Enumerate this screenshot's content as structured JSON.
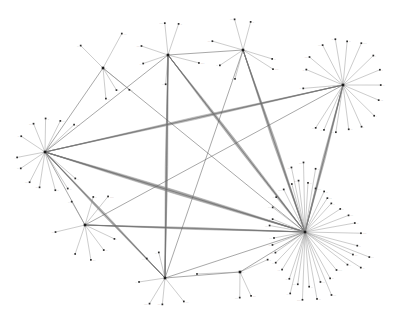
{
  "figure": {
    "kind": "network-graph",
    "layout": "force-directed",
    "background_color": "#ffffff",
    "width": 398,
    "height": 336,
    "edge_color": "#8d8d8d",
    "node_color": "#2b2b2b",
    "label_color": "#333333",
    "node_marker": "square-dot",
    "label_text_legible": false,
    "label_placeholder": "▫",
    "hub_count": 8,
    "node_count": 188,
    "edge_count": 262
  },
  "hubs": [
    {
      "id": "hub-upper-left",
      "name": "upper-left-hub",
      "x": 103,
      "y": 68,
      "degree": 14,
      "label": "▫▫"
    },
    {
      "id": "hub-top-center",
      "name": "top-center-hub",
      "x": 168,
      "y": 55,
      "degree": 22,
      "label": "▫▫"
    },
    {
      "id": "hub-top-right",
      "name": "top-right-hub",
      "x": 243,
      "y": 50,
      "degree": 20,
      "label": "▫▫"
    },
    {
      "id": "hub-right-upper",
      "name": "right-upper-hub",
      "x": 343,
      "y": 85,
      "degree": 28,
      "label": "▫▫"
    },
    {
      "id": "hub-left",
      "name": "left-hub",
      "x": 45,
      "y": 152,
      "degree": 24,
      "label": "▫▫"
    },
    {
      "id": "hub-lower-left",
      "name": "lower-left-hub",
      "x": 85,
      "y": 225,
      "degree": 16,
      "label": "▫▫"
    },
    {
      "id": "hub-bottom-mid",
      "name": "bottom-mid-hub",
      "x": 165,
      "y": 278,
      "degree": 18,
      "label": "▫▫"
    },
    {
      "id": "hub-bottom-right",
      "name": "bottom-right-hub",
      "x": 240,
      "y": 272,
      "degree": 9,
      "label": "▫▫"
    },
    {
      "id": "hub-right-dense",
      "name": "right-dense-hub",
      "x": 305,
      "y": 232,
      "degree": 52,
      "label": "▫▫"
    }
  ],
  "hub_links": [
    {
      "from": "hub-upper-left",
      "to": "hub-left"
    },
    {
      "from": "hub-upper-left",
      "to": "hub-right-dense"
    },
    {
      "from": "hub-top-center",
      "to": "hub-right-dense"
    },
    {
      "from": "hub-top-center",
      "to": "hub-bottom-mid"
    },
    {
      "from": "hub-top-center",
      "to": "hub-left"
    },
    {
      "from": "hub-top-right",
      "to": "hub-right-dense"
    },
    {
      "from": "hub-top-right",
      "to": "hub-bottom-mid"
    },
    {
      "from": "hub-right-upper",
      "to": "hub-right-dense"
    },
    {
      "from": "hub-right-upper",
      "to": "hub-left"
    },
    {
      "from": "hub-right-upper",
      "to": "hub-lower-left"
    },
    {
      "from": "hub-left",
      "to": "hub-right-dense"
    },
    {
      "from": "hub-left",
      "to": "hub-lower-left"
    },
    {
      "from": "hub-lower-left",
      "to": "hub-right-dense"
    },
    {
      "from": "hub-bottom-mid",
      "to": "hub-right-dense"
    },
    {
      "from": "hub-bottom-mid",
      "to": "hub-bottom-right"
    },
    {
      "from": "hub-bottom-right",
      "to": "hub-right-dense"
    },
    {
      "from": "hub-top-center",
      "to": "hub-top-right"
    },
    {
      "from": "hub-left",
      "to": "hub-bottom-mid"
    }
  ],
  "bundles": [
    {
      "name": "left-to-right-dense-bundle",
      "from": "hub-left",
      "to": "hub-right-dense",
      "strands": 11,
      "spread": 7
    },
    {
      "name": "topcenter-to-dense-bundle",
      "from": "hub-top-center",
      "to": "hub-right-dense",
      "strands": 9,
      "spread": 6
    },
    {
      "name": "topright-to-dense-bundle",
      "from": "hub-top-right",
      "to": "hub-right-dense",
      "strands": 8,
      "spread": 6
    },
    {
      "name": "left-to-bottommid-bundle",
      "from": "hub-left",
      "to": "hub-bottom-mid",
      "strands": 7,
      "spread": 5
    },
    {
      "name": "rightupper-to-left-bundle",
      "from": "hub-right-upper",
      "to": "hub-left",
      "strands": 6,
      "spread": 5
    },
    {
      "name": "bottommid-to-topcenter-bundle",
      "from": "hub-bottom-mid",
      "to": "hub-top-center",
      "strands": 8,
      "spread": 5
    },
    {
      "name": "lowerleft-to-dense-bundle",
      "from": "hub-lower-left",
      "to": "hub-right-dense",
      "strands": 6,
      "spread": 4
    },
    {
      "name": "rightupper-to-dense-bundle",
      "from": "hub-right-upper",
      "to": "hub-right-dense",
      "strands": 7,
      "spread": 5
    }
  ],
  "leaves": [
    {
      "hub": "hub-upper-left",
      "angle": -62,
      "radius": 38,
      "label": "▫▫▫"
    },
    {
      "hub": "hub-upper-left",
      "angle": -136,
      "radius": 30,
      "label": "▫▫"
    },
    {
      "hub": "hub-upper-left",
      "angle": 86,
      "radius": 32,
      "label": "▫▫"
    },
    {
      "hub": "hub-upper-left",
      "angle": 58,
      "radius": 26,
      "label": "▫"
    },
    {
      "hub": "hub-upper-left",
      "angle": 40,
      "radius": 34,
      "label": "▫▫"
    },
    {
      "hub": "hub-top-center",
      "angle": -96,
      "radius": 31,
      "label": "▫▫▫▫"
    },
    {
      "hub": "hub-top-center",
      "angle": -72,
      "radius": 33,
      "label": "▫▫"
    },
    {
      "hub": "hub-top-center",
      "angle": -160,
      "radius": 30,
      "label": "▫▫▫"
    },
    {
      "hub": "hub-top-center",
      "angle": 160,
      "radius": 27,
      "label": "▫▫"
    },
    {
      "hub": "hub-top-center",
      "angle": 14,
      "radius": 32,
      "label": "▫▫▫▫"
    },
    {
      "hub": "hub-top-center",
      "angle": 96,
      "radius": 30,
      "label": "▫▫"
    },
    {
      "hub": "hub-top-right",
      "angle": -104,
      "radius": 30,
      "label": "▫▫▫"
    },
    {
      "hub": "hub-top-right",
      "angle": -74,
      "radius": 28,
      "label": "▫▫"
    },
    {
      "hub": "hub-top-right",
      "angle": -164,
      "radius": 31,
      "label": "▫▫▫"
    },
    {
      "hub": "hub-top-right",
      "angle": 18,
      "radius": 30,
      "label": "▫▫"
    },
    {
      "hub": "hub-top-right",
      "angle": 34,
      "radius": 37,
      "label": "▫▫▫▫"
    },
    {
      "hub": "hub-top-right",
      "angle": 148,
      "radius": 29,
      "label": "▫▫"
    },
    {
      "hub": "hub-top-right",
      "angle": 104,
      "radius": 28,
      "label": "▫▫"
    },
    {
      "hub": "hub-right-upper",
      "angle": -118,
      "radius": 44,
      "label": "▫▫▫"
    },
    {
      "hub": "hub-right-upper",
      "angle": -100,
      "radius": 46,
      "label": "▫▫"
    },
    {
      "hub": "hub-right-upper",
      "angle": -84,
      "radius": 44,
      "label": "▫▫"
    },
    {
      "hub": "hub-right-upper",
      "angle": -66,
      "radius": 45,
      "label": "▫▫▫▫"
    },
    {
      "hub": "hub-right-upper",
      "angle": -140,
      "radius": 42,
      "label": "▫▫▫"
    },
    {
      "hub": "hub-right-upper",
      "angle": -158,
      "radius": 40,
      "label": "▫▫"
    },
    {
      "hub": "hub-right-upper",
      "angle": 176,
      "radius": 38,
      "label": "▫▫"
    },
    {
      "hub": "hub-right-upper",
      "angle": -44,
      "radius": 42,
      "label": "▫"
    },
    {
      "hub": "hub-right-upper",
      "angle": -22,
      "radius": 40,
      "label": "▫"
    },
    {
      "hub": "hub-right-upper",
      "angle": 0,
      "radius": 38,
      "label": "▫▫"
    },
    {
      "hub": "hub-right-upper",
      "angle": 22,
      "radius": 40,
      "label": "▫▫▫"
    },
    {
      "hub": "hub-right-upper",
      "angle": 44,
      "radius": 42,
      "label": "▫"
    },
    {
      "hub": "hub-right-upper",
      "angle": 66,
      "radius": 44,
      "label": "▫"
    },
    {
      "hub": "hub-right-upper",
      "angle": 84,
      "radius": 46,
      "label": "▫▫"
    },
    {
      "hub": "hub-right-upper",
      "angle": 100,
      "radius": 48,
      "label": "▫▫▫"
    },
    {
      "hub": "hub-right-upper",
      "angle": 112,
      "radius": 50,
      "label": "▫▫"
    },
    {
      "hub": "hub-right-upper",
      "angle": 124,
      "radius": 52,
      "label": "▫▫"
    },
    {
      "hub": "hub-left",
      "angle": -90,
      "radius": 34,
      "label": "▫▫"
    },
    {
      "hub": "hub-left",
      "angle": -112,
      "radius": 32,
      "label": "▫▫▫"
    },
    {
      "hub": "hub-left",
      "angle": -64,
      "radius": 36,
      "label": "▫▫▫"
    },
    {
      "hub": "hub-left",
      "angle": -44,
      "radius": 38,
      "label": "▫▫▫▫"
    },
    {
      "hub": "hub-left",
      "angle": -146,
      "radius": 30,
      "label": "▫▫"
    },
    {
      "hub": "hub-left",
      "angle": 170,
      "radius": 28,
      "label": "▫"
    },
    {
      "hub": "hub-left",
      "angle": 146,
      "radius": 30,
      "label": "▫▫"
    },
    {
      "hub": "hub-left",
      "angle": 118,
      "radius": 34,
      "label": "▫▫▫"
    },
    {
      "hub": "hub-left",
      "angle": 98,
      "radius": 36,
      "label": "▫▫"
    },
    {
      "hub": "hub-left",
      "angle": 76,
      "radius": 40,
      "label": "▫▫"
    },
    {
      "hub": "hub-left",
      "angle": 58,
      "radius": 44,
      "label": "▫▫"
    },
    {
      "hub": "hub-left",
      "angle": 42,
      "radius": 40,
      "label": "▫▫"
    },
    {
      "hub": "hub-lower-left",
      "angle": -74,
      "radius": 30,
      "label": "▫▫"
    },
    {
      "hub": "hub-lower-left",
      "angle": -52,
      "radius": 36,
      "label": "▫▫▫▫"
    },
    {
      "hub": "hub-lower-left",
      "angle": -120,
      "radius": 28,
      "label": "▫▫"
    },
    {
      "hub": "hub-lower-left",
      "angle": 168,
      "radius": 30,
      "label": "▫▫"
    },
    {
      "hub": "hub-lower-left",
      "angle": 108,
      "radius": 32,
      "label": "▫"
    },
    {
      "hub": "hub-lower-left",
      "angle": 80,
      "radius": 34,
      "label": "▫▫▫"
    },
    {
      "hub": "hub-lower-left",
      "angle": 52,
      "radius": 30,
      "label": "▫▫"
    },
    {
      "hub": "hub-lower-left",
      "angle": 24,
      "radius": 34,
      "label": "▫"
    },
    {
      "hub": "hub-bottom-mid",
      "angle": -104,
      "radius": 28,
      "label": "▫▫"
    },
    {
      "hub": "hub-bottom-mid",
      "angle": -134,
      "radius": 26,
      "label": "▫▫▫"
    },
    {
      "hub": "hub-bottom-mid",
      "angle": 172,
      "radius": 28,
      "label": "▫▫"
    },
    {
      "hub": "hub-bottom-mid",
      "angle": 120,
      "radius": 30,
      "label": "▫▫▫▫"
    },
    {
      "hub": "hub-bottom-mid",
      "angle": 96,
      "radius": 28,
      "label": "▫▫▫"
    },
    {
      "hub": "hub-bottom-mid",
      "angle": 52,
      "radius": 32,
      "label": "▫▫▫"
    },
    {
      "hub": "hub-bottom-right",
      "angle": 66,
      "radius": 26,
      "label": "▫▫▫"
    },
    {
      "hub": "hub-bottom-right",
      "angle": 92,
      "radius": 24,
      "label": "▫▫▫"
    },
    {
      "hub": "hub-bottom-right",
      "angle": -24,
      "radius": 30,
      "label": "▫▫"
    },
    {
      "hub": "hub-bottom-right",
      "angle": 178,
      "radius": 44,
      "label": "▫"
    },
    {
      "hub": "hub-right-dense",
      "angle": -142,
      "radius": 42,
      "label": "▫▫▫"
    },
    {
      "hub": "hub-right-dense",
      "angle": -130,
      "radius": 46,
      "label": "▫▫"
    },
    {
      "hub": "hub-right-dense",
      "angle": -118,
      "radius": 48,
      "label": "▫▫▫▫"
    },
    {
      "hub": "hub-right-dense",
      "angle": -106,
      "radius": 50,
      "label": "▫▫"
    },
    {
      "hub": "hub-right-dense",
      "angle": -96,
      "radius": 52,
      "label": "▫▫▫"
    },
    {
      "hub": "hub-right-dense",
      "angle": -86,
      "radius": 50,
      "label": "▫▫"
    },
    {
      "hub": "hub-right-dense",
      "angle": -76,
      "radius": 46,
      "label": "▫▫▫▫"
    },
    {
      "hub": "hub-right-dense",
      "angle": -66,
      "radius": 44,
      "label": "▫▫"
    },
    {
      "hub": "hub-right-dense",
      "angle": -56,
      "radius": 42,
      "label": "▫▫▫"
    },
    {
      "hub": "hub-right-dense",
      "angle": -46,
      "radius": 40,
      "label": "▫▫"
    },
    {
      "hub": "hub-right-dense",
      "angle": -34,
      "radius": 44,
      "label": "▫▫"
    },
    {
      "hub": "hub-right-dense",
      "angle": -22,
      "radius": 48,
      "label": "▫▫▫"
    },
    {
      "hub": "hub-right-dense",
      "angle": -10,
      "radius": 52,
      "label": "▫▫"
    },
    {
      "hub": "hub-right-dense",
      "angle": 2,
      "radius": 54,
      "label": "▫▫▫▫"
    },
    {
      "hub": "hub-right-dense",
      "angle": 14,
      "radius": 56,
      "label": "▫▫"
    },
    {
      "hub": "hub-right-dense",
      "angle": 26,
      "radius": 54,
      "label": "▫▫▫"
    },
    {
      "hub": "hub-right-dense",
      "angle": 38,
      "radius": 52,
      "label": "▫▫"
    },
    {
      "hub": "hub-right-dense",
      "angle": 50,
      "radius": 50,
      "label": "▫▫▫▫"
    },
    {
      "hub": "hub-right-dense",
      "angle": 62,
      "radius": 52,
      "label": "▫▫"
    },
    {
      "hub": "hub-right-dense",
      "angle": 74,
      "radius": 54,
      "label": "▫▫▫"
    },
    {
      "hub": "hub-right-dense",
      "angle": 86,
      "radius": 56,
      "label": "▫▫"
    },
    {
      "hub": "hub-right-dense",
      "angle": 98,
      "radius": 54,
      "label": "▫▫▫▫"
    },
    {
      "hub": "hub-right-dense",
      "angle": 110,
      "radius": 50,
      "label": "▫▫"
    },
    {
      "hub": "hub-right-dense",
      "angle": 122,
      "radius": 46,
      "label": "▫▫▫"
    },
    {
      "hub": "hub-right-dense",
      "angle": 134,
      "radius": 42,
      "label": "▫▫"
    },
    {
      "hub": "hub-right-dense",
      "angle": 146,
      "radius": 38,
      "label": "▫▫▫"
    },
    {
      "hub": "hub-right-dense",
      "angle": 158,
      "radius": 34,
      "label": "▫▫"
    },
    {
      "hub": "hub-right-dense",
      "angle": 170,
      "radius": 32,
      "label": "▫▫▫"
    },
    {
      "hub": "hub-right-dense",
      "angle": -158,
      "radius": 34,
      "label": "▫▫"
    },
    {
      "hub": "hub-right-dense",
      "angle": -170,
      "radius": 36,
      "label": "▫▫▫"
    },
    {
      "hub": "hub-right-dense",
      "angle": -101,
      "radius": 66,
      "label": "▫▫"
    },
    {
      "hub": "hub-right-dense",
      "angle": -91,
      "radius": 68,
      "label": "▫▫▫"
    },
    {
      "hub": "hub-right-dense",
      "angle": -81,
      "radius": 64,
      "label": "▫▫"
    },
    {
      "hub": "hub-right-dense",
      "angle": 68,
      "radius": 68,
      "label": "▫▫▫"
    },
    {
      "hub": "hub-right-dense",
      "angle": 80,
      "radius": 70,
      "label": "▫▫"
    },
    {
      "hub": "hub-right-dense",
      "angle": 92,
      "radius": 68,
      "label": "▫▫▫▫"
    },
    {
      "hub": "hub-right-dense",
      "angle": 104,
      "radius": 64,
      "label": "▫▫"
    },
    {
      "hub": "hub-right-dense",
      "angle": 20,
      "radius": 70,
      "label": "▫▫▫"
    },
    {
      "hub": "hub-right-dense",
      "angle": 32,
      "radius": 68,
      "label": "▫▫"
    }
  ]
}
